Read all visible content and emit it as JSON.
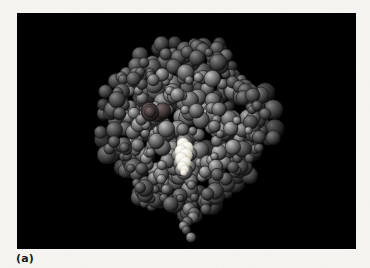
{
  "figure": {
    "caption": "(a)",
    "panel_label": "(a)",
    "page_background_color": "#f6f5f2",
    "panel_background_color": "#000000",
    "panel_bounds": {
      "x": 17,
      "y": 13,
      "width": 339,
      "height": 236
    },
    "rendering_style": "CPK space-filling spheres, grayscale, black background"
  },
  "molecule": {
    "body_color_light": "#9a9a9a",
    "body_color_mid": "#6e6e6e",
    "body_color_dark": "#2b2b2b",
    "outline_color": "#151515",
    "highlight_color": "#f2f0e8",
    "dark_atom_color": "#3a3434",
    "atom_count_rendered": 520,
    "center": {
      "x": 168,
      "y": 118
    },
    "extent": {
      "left": 80,
      "right": 252,
      "top": 16,
      "bottom": 218
    },
    "ligand": {
      "name": "heme-ligand-highlight",
      "color": "#f4f2e9",
      "x": 158,
      "y": 128,
      "width": 18,
      "height": 32
    },
    "dark_patch": {
      "name": "dark-atom-cluster",
      "color": "#4a4040",
      "x": 140,
      "y": 103,
      "radius": 11
    },
    "tail": {
      "name": "lower-chain-tail",
      "x": 172,
      "y": 196,
      "length": 22
    }
  }
}
